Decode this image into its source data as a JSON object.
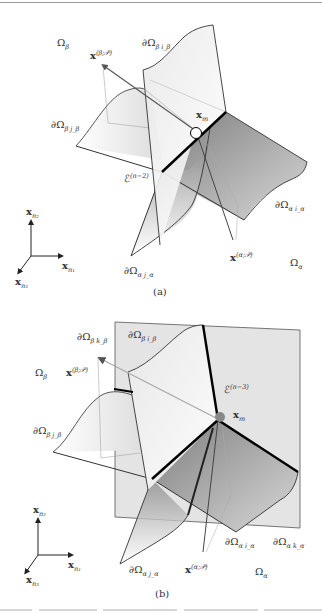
{
  "figure": {
    "panels": [
      {
        "id": "a",
        "caption": "(a)",
        "labels": {
          "omega_beta": "Ω",
          "omega_beta_sub": "β",
          "boundary_beta_beta_top": "∂Ω",
          "boundary_beta_beta_top_sub": "β i_β",
          "x_beta": "x",
          "x_beta_sup": "(β;𝒫)",
          "x_m": "x",
          "x_m_sub": "m",
          "boundary_beta_left": "∂Ω",
          "boundary_beta_left_sub": "β j_β",
          "edge": "ℰ",
          "edge_sup": "(n−2)",
          "boundary_alpha_right": "∂Ω",
          "boundary_alpha_right_sub": "α i_α",
          "boundary_alpha_bottom": "∂Ω",
          "boundary_alpha_bottom_sub": "α j_α",
          "x_alpha": "x",
          "x_alpha_sup": "(α;𝒫)",
          "omega_alpha": "Ω",
          "omega_alpha_sub": "α"
        }
      },
      {
        "id": "b",
        "caption": "(b)",
        "labels": {
          "boundary_beta_k": "∂Ω",
          "boundary_beta_k_sub": "β k_β",
          "boundary_beta_top": "∂Ω",
          "boundary_beta_top_sub": "β i_β",
          "omega_beta": "Ω",
          "omega_beta_sub": "β",
          "x_beta": "x",
          "x_beta_sup": "(β;𝒫)",
          "edge": "ℰ",
          "edge_sup": "(n−3)",
          "x_m": "x",
          "x_m_sub": "m",
          "boundary_beta_left": "∂Ω",
          "boundary_beta_left_sub": "β j_β",
          "boundary_alpha_i": "∂Ω",
          "boundary_alpha_i_sub": "α i_α",
          "boundary_alpha_k": "∂Ω",
          "boundary_alpha_k_sub": "α k_α",
          "boundary_alpha_j": "∂Ω",
          "boundary_alpha_j_sub": "α j_α",
          "x_alpha": "x",
          "x_alpha_sup": "(α;𝒫)",
          "omega_alpha": "Ω",
          "omega_alpha_sub": "α"
        }
      }
    ],
    "axes": {
      "x1": "x",
      "x1_sub": "n₁",
      "x2": "x",
      "x2_sub": "n₂",
      "x3": "x",
      "x3_sub": "n₃"
    }
  }
}
